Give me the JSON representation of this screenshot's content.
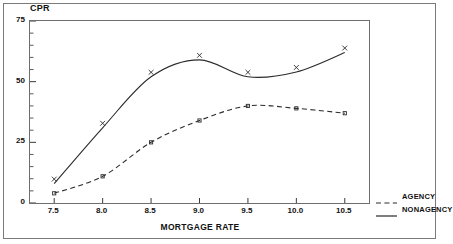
{
  "chart_data": {
    "type": "line",
    "title": "",
    "xlabel": "MORTGAGE RATE",
    "ylabel": "CPR",
    "xlim": [
      7.25,
      10.75
    ],
    "ylim": [
      0,
      75
    ],
    "grid": false,
    "legend_position": "outside-bottom-right",
    "x": [
      7.5,
      8.0,
      8.5,
      9.0,
      9.5,
      10.0,
      10.5
    ],
    "xtick_labels": [
      "7.5",
      "8.0",
      "8.5",
      "9.0",
      "9.5",
      "10.0",
      "10.5"
    ],
    "ytick_labels": [
      "0",
      "25",
      "50",
      "75"
    ],
    "yticks_major": [
      0,
      25,
      50,
      75
    ],
    "yticks_minor": [
      5,
      10,
      15,
      20,
      30,
      35,
      40,
      45,
      55,
      60,
      65,
      70
    ],
    "series": [
      {
        "name": "AGENCY",
        "style": "dashed",
        "marker": "square",
        "color": "#2b2b2b",
        "values": [
          4,
          11,
          25,
          34,
          40,
          39,
          37
        ]
      },
      {
        "name": "NONAGENCY",
        "style": "solid",
        "marker": "x",
        "color": "#2b2b2b",
        "values": [
          8,
          31,
          52,
          59,
          52,
          54,
          62
        ]
      }
    ]
  },
  "axes": {
    "y_title": "CPR",
    "x_title": "MORTGAGE RATE"
  },
  "legend": {
    "items": [
      {
        "label": "AGENCY",
        "style": "dashed"
      },
      {
        "label": "NONAGENCY",
        "style": "solid"
      }
    ]
  }
}
